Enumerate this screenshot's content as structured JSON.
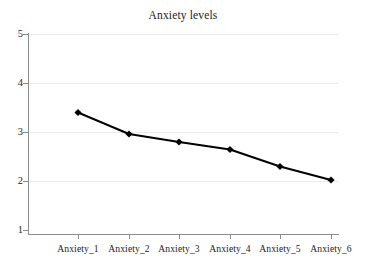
{
  "chart_data": {
    "type": "line",
    "title": "Anxiety levels",
    "xlabel": "",
    "ylabel": "",
    "categories": [
      "Anxiety_1",
      "Anxiety_2",
      "Anxiety_3",
      "Anxiety_4",
      "Anxiety_5",
      "Anxiety_6"
    ],
    "series": [
      {
        "name": "Anxiety levels",
        "values": [
          3.43,
          3.0,
          2.84,
          2.69,
          2.35,
          2.08
        ],
        "color": "#000000",
        "marker": "diamond"
      }
    ],
    "ylim": [
      1,
      5
    ],
    "yticks": [
      1,
      2,
      3,
      4,
      5
    ],
    "ytick_labels": [
      "1",
      "2",
      "3",
      "4",
      "5"
    ],
    "grid": "horizontal",
    "grid_color": "#eceaea",
    "legend": "none",
    "axis_color": "#8d8d8d",
    "background": "#ffffff"
  }
}
